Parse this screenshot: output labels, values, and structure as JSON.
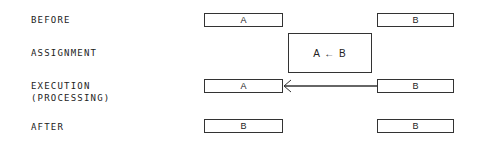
{
  "diagram": {
    "rows": [
      {
        "label": "BEFORE",
        "left_box": "A",
        "right_box": "B"
      },
      {
        "label": "ASSIGNMENT",
        "statement": "A ← B"
      },
      {
        "label_line1": "EXECUTION",
        "label_line2": "(PROCESSING)",
        "left_box": "A",
        "right_box": "B",
        "arrow": "B → A"
      },
      {
        "label": "AFTER",
        "left_box": "B",
        "right_box": "B"
      }
    ],
    "colors": {
      "stroke": "#333333",
      "text": "#222222",
      "background": "#ffffff"
    }
  }
}
